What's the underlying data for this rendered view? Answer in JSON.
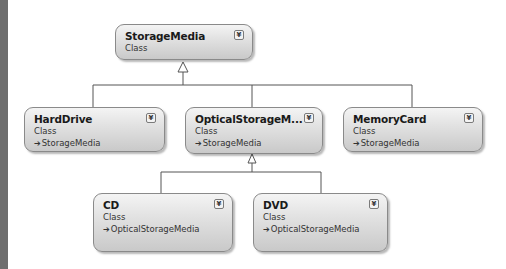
{
  "diagram": {
    "classes": [
      {
        "id": "storagemedia",
        "name": "StorageMedia",
        "kind": "Class",
        "base": null,
        "collapse_icon": "double-chevron-down-icon"
      },
      {
        "id": "harddrive",
        "name": "HardDrive",
        "kind": "Class",
        "base": "StorageMedia",
        "collapse_icon": "double-chevron-down-icon"
      },
      {
        "id": "opticalstoragemedia",
        "name": "OpticalStorageM...",
        "kind": "Class",
        "base": "StorageMedia",
        "collapse_icon": "double-chevron-down-icon"
      },
      {
        "id": "memorycard",
        "name": "MemoryCard",
        "kind": "Class",
        "base": "StorageMedia",
        "collapse_icon": "double-chevron-down-icon"
      },
      {
        "id": "cd",
        "name": "CD",
        "kind": "Class",
        "base": "OpticalStorageMedia",
        "collapse_icon": "double-chevron-down-icon"
      },
      {
        "id": "dvd",
        "name": "DVD",
        "kind": "Class",
        "base": "OpticalStorageMedia",
        "collapse_icon": "double-chevron-down-icon"
      }
    ],
    "inheritance_arrow_glyph": "➔",
    "toggle_glyph": "¥",
    "edges": [
      {
        "from": "HardDrive",
        "to": "StorageMedia"
      },
      {
        "from": "OpticalStorageMedia",
        "to": "StorageMedia"
      },
      {
        "from": "MemoryCard",
        "to": "StorageMedia"
      },
      {
        "from": "CD",
        "to": "OpticalStorageMedia"
      },
      {
        "from": "DVD",
        "to": "OpticalStorageMedia"
      }
    ],
    "colors": {
      "line": "#555555",
      "shape_border": "#8a8a8a",
      "side_bar": "#6e6e6e"
    }
  }
}
